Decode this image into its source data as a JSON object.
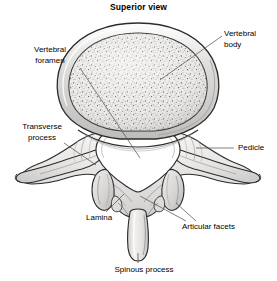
{
  "figure": {
    "title": "Superior view",
    "width": 277,
    "height": 281,
    "background_color": "#ffffff"
  },
  "labels": [
    {
      "key": "vertebral_foramen",
      "text": "Vertebral\nforamen",
      "name": "label-vertebral-foramen"
    },
    {
      "key": "vertebral_body",
      "text": "Vertebral\nbody",
      "name": "label-vertebral-body"
    },
    {
      "key": "transverse_process",
      "text": "Transverse\nprocess",
      "name": "label-transverse-process"
    },
    {
      "key": "pedicle",
      "text": "Pedicle",
      "name": "label-pedicle"
    },
    {
      "key": "lamina",
      "text": "Lamina",
      "name": "label-lamina"
    },
    {
      "key": "articular_facets",
      "text": "Articular facets",
      "name": "label-articular-facets"
    },
    {
      "key": "spinous_process",
      "text": "Spinous process",
      "name": "label-spinous-process"
    }
  ],
  "label_text": {
    "vertebral_foramen": "Vertebral\nforamen",
    "vertebral_body": "Vertebral\nbody",
    "transverse_process": "Transverse\nprocess",
    "pedicle": "Pedicle",
    "lamina": "Lamina",
    "articular_facets": "Articular facets",
    "spinous_process": "Spinous process"
  },
  "colors": {
    "outline": "#2b2b2b",
    "bone_light": "#f0eeec",
    "bone_mid": "#e2e0de",
    "bone_shade": "#cfcdcb",
    "rim_gray": "#d6d4d2",
    "body_fill": "#e8e6e4",
    "stipple": "#4a4a4a",
    "foramen_fill": "#ffffff",
    "leader_line": "#555555",
    "text": "#000000"
  }
}
